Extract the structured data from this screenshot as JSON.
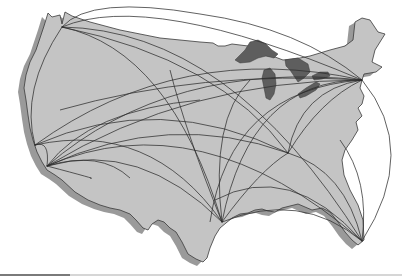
{
  "figure": {
    "title": "",
    "colors": {
      "background": "#ffffff",
      "land": "#c4c4c4",
      "shadow": "#9a9a9a",
      "lakes": "#5e5e5e",
      "outline": "#3a3a3a",
      "routes": "#2e2e2e"
    }
  },
  "map": {
    "region": "Contiguous United States",
    "hubs": [
      {
        "name": "Seattle",
        "x": 62,
        "y": 27
      },
      {
        "name": "San Francisco",
        "x": 35,
        "y": 145
      },
      {
        "name": "Los Angeles",
        "x": 47,
        "y": 166
      },
      {
        "name": "Houston",
        "x": 222,
        "y": 222
      },
      {
        "name": "Atlanta",
        "x": 288,
        "y": 153
      },
      {
        "name": "Miami",
        "x": 362,
        "y": 241
      },
      {
        "name": "New York",
        "x": 362,
        "y": 80
      }
    ],
    "route_count": 30
  },
  "footer": {
    "rule": "split horizontal rule"
  }
}
